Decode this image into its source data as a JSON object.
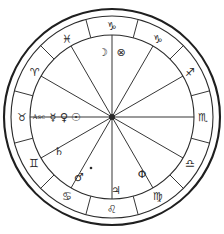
{
  "chart_data": {
    "type": "wheel",
    "center": {
      "cx": 112,
      "cy": 117
    },
    "radii": {
      "outer_rim": 108,
      "inner_rim": 101,
      "sign_band_inner": 82,
      "hub": 3
    },
    "house_count": 12,
    "rotation_note": "Aquarius occupies the top sector; signs run counterclockwise",
    "signs": [
      {
        "name": "Aquarius",
        "glyph": "♑",
        "angle_deg": 90,
        "label_x": 112,
        "label_y": 26
      },
      {
        "name": "Pisces",
        "glyph": "♓",
        "angle_deg": 120,
        "label_x": 67,
        "label_y": 39
      },
      {
        "name": "Aries",
        "glyph": "♈",
        "angle_deg": 150,
        "label_x": 35,
        "label_y": 72
      },
      {
        "name": "Taurus",
        "glyph": "♉",
        "angle_deg": 180,
        "label_x": 22,
        "label_y": 117
      },
      {
        "name": "Gemini",
        "glyph": "♊",
        "angle_deg": 210,
        "label_x": 34,
        "label_y": 163
      },
      {
        "name": "Cancer",
        "glyph": "♋",
        "angle_deg": 240,
        "label_x": 67,
        "label_y": 196
      },
      {
        "name": "Leo",
        "glyph": "♌",
        "angle_deg": 270,
        "label_x": 112,
        "label_y": 209
      },
      {
        "name": "Virgo",
        "glyph": "♍",
        "angle_deg": 300,
        "label_x": 158,
        "label_y": 196
      },
      {
        "name": "Libra",
        "glyph": "♎",
        "angle_deg": 330,
        "label_x": 190,
        "label_y": 163
      },
      {
        "name": "Scorpio",
        "glyph": "♏",
        "angle_deg": 0,
        "label_x": 203,
        "label_y": 117
      },
      {
        "name": "Sagittarius",
        "glyph": "♐",
        "angle_deg": 30,
        "label_x": 190,
        "label_y": 72
      },
      {
        "name": "Capricorn",
        "glyph": "♑",
        "angle_deg": 60,
        "label_x": 158,
        "label_y": 39
      }
    ],
    "sign_glyph_overrides": {
      "capricorn_display": "♑",
      "note": "outer ring uses standard zodiac glyph set"
    },
    "placements": [
      {
        "body": "Moon",
        "glyph": "☽",
        "sign": "Aquarius",
        "x": 103,
        "y": 52
      },
      {
        "body": "Part of Fortune",
        "glyph": "⊗",
        "sign": "Aquarius",
        "x": 121,
        "y": 52
      },
      {
        "body": "Ascendant",
        "glyph": "Asc",
        "sign": "Taurus",
        "x": 39,
        "y": 117
      },
      {
        "body": "Mercury",
        "glyph": "☿",
        "sign": "Taurus",
        "x": 53,
        "y": 117
      },
      {
        "body": "Venus",
        "glyph": "♀",
        "sign": "Taurus",
        "x": 64,
        "y": 117
      },
      {
        "body": "Sun",
        "glyph": "☉",
        "sign": "Taurus",
        "x": 76,
        "y": 117
      },
      {
        "body": "Saturn",
        "glyph": "♄",
        "sign": "Gemini",
        "x": 59,
        "y": 151
      },
      {
        "body": "Mars",
        "glyph": "♂",
        "sign": "Cancer",
        "x": 79,
        "y": 177
      },
      {
        "body": "Point",
        "glyph": "·",
        "sign": "Cancer",
        "x": 91,
        "y": 168
      },
      {
        "body": "Jupiter",
        "glyph": "♃",
        "sign": "Leo",
        "x": 116,
        "y": 190
      },
      {
        "body": "Phi Point",
        "glyph": "Φ",
        "sign": "Virgo",
        "x": 142,
        "y": 174
      }
    ],
    "colors": {
      "line": "#2b2b2b",
      "rim": "#1f1f1f",
      "background": "#ffffff",
      "glyph": "#2b2b2b"
    },
    "house_cusp_angles_deg": [
      0,
      30,
      60,
      90,
      120,
      150,
      180,
      210,
      240,
      270,
      300,
      330
    ]
  }
}
